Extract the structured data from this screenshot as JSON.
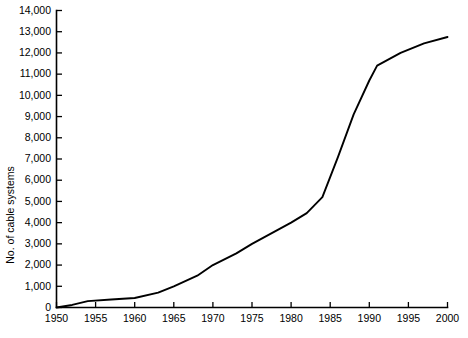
{
  "chart_data": {
    "type": "line",
    "title": "",
    "xlabel": "",
    "ylabel": "No. of cable systems",
    "xlim": [
      1950,
      2000
    ],
    "ylim": [
      0,
      14000
    ],
    "grid": false,
    "legend": null,
    "x_ticks": [
      1950,
      1955,
      1960,
      1965,
      1970,
      1975,
      1980,
      1985,
      1990,
      1995,
      2000
    ],
    "x_tick_labels": [
      "1950",
      "1955",
      "1960",
      "1965",
      "1970",
      "1975",
      "1980",
      "1985",
      "1990",
      "1995",
      "2000"
    ],
    "y_ticks": [
      0,
      1000,
      2000,
      3000,
      4000,
      5000,
      6000,
      7000,
      8000,
      9000,
      10000,
      11000,
      12000,
      13000,
      14000
    ],
    "y_tick_labels": [
      "0",
      "1,000",
      "2,000",
      "3,000",
      "4,000",
      "5,000",
      "6,000",
      "7,000",
      "8,000",
      "9,000",
      "10,000",
      "11,000",
      "12,000",
      "13,000",
      "14,000"
    ],
    "series": [
      {
        "name": "No. of cable systems",
        "color": "#000000",
        "x": [
          1950,
          1952,
          1954,
          1957,
          1960,
          1963,
          1965,
          1968,
          1970,
          1973,
          1975,
          1978,
          1980,
          1982,
          1984,
          1986,
          1988,
          1990,
          1991,
          1994,
          1997,
          2000
        ],
        "values": [
          0,
          120,
          300,
          380,
          450,
          700,
          1000,
          1500,
          2000,
          2550,
          3000,
          3600,
          4000,
          4450,
          5200,
          7100,
          9100,
          10700,
          11400,
          12000,
          12450,
          12750
        ]
      }
    ]
  },
  "axis": {
    "y_title": "No. of cable systems"
  }
}
